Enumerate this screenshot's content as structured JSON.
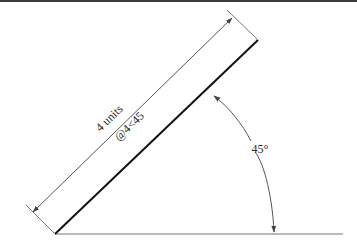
{
  "figure": {
    "colors": {
      "border": "#3a3a3a",
      "main_line": "#111111",
      "dimension": "#555555",
      "baseline": "#777777",
      "text": "#2a2a2a"
    },
    "labels": {
      "length": "4 units",
      "polar_input": "@4<45",
      "angle": "45°"
    },
    "geometry": {
      "origin": [
        55,
        234
      ],
      "end": [
        258,
        40
      ],
      "baseline_end": [
        343,
        234
      ],
      "angle_deg": 45,
      "length_units": 4
    }
  }
}
